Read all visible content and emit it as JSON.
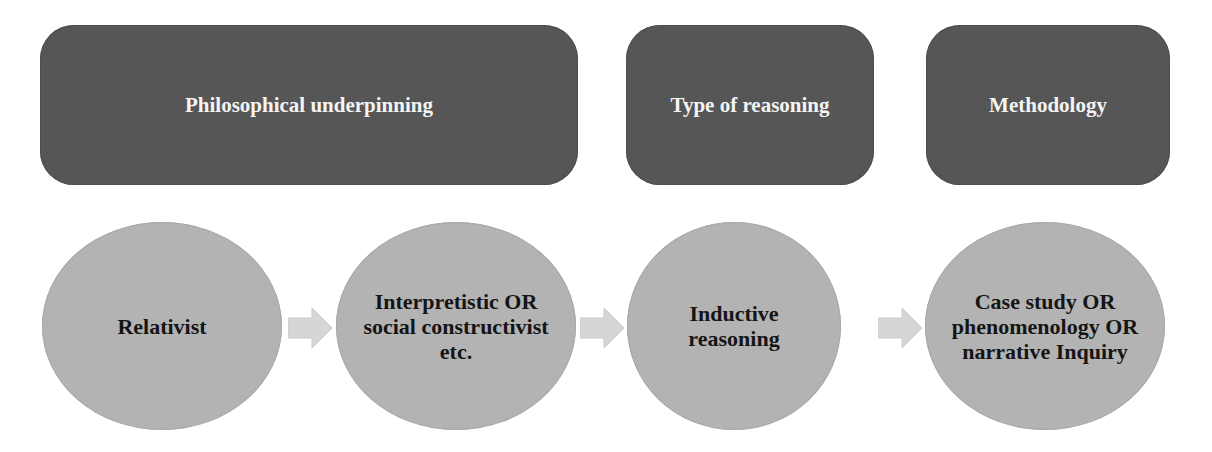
{
  "diagram": {
    "headers": [
      {
        "label": "Philosophical underpinning"
      },
      {
        "label": "Type of reasoning"
      },
      {
        "label": "Methodology"
      }
    ],
    "steps": [
      {
        "label": "Relativist"
      },
      {
        "label": "Interpretistic OR\nsocial constructivist\netc."
      },
      {
        "label": "Inductive\nreasoning"
      },
      {
        "label": "Case study OR\nphenomenology OR\nnarrative Inquiry"
      }
    ],
    "connectors": [
      "arrow-right-icon",
      "arrow-right-icon",
      "arrow-right-icon"
    ],
    "colors": {
      "header_fill": "#565656",
      "header_text": "#f4f4f4",
      "circle_fill": "#b3b3b3",
      "circle_text": "#151515",
      "arrow_fill": "#d6d6d6"
    }
  }
}
